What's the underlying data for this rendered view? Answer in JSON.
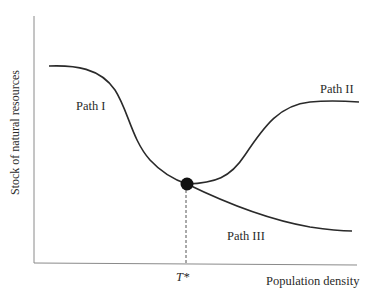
{
  "figure": {
    "y_axis_label": "Stock of natural resources",
    "x_axis_label": "Population density",
    "threshold_label": "T*",
    "paths": [
      {
        "name": "Path I",
        "description": "declining from high stock to threshold point"
      },
      {
        "name": "Path II",
        "description": "recovering upward after threshold"
      },
      {
        "name": "Path III",
        "description": "continuing decline after threshold"
      }
    ]
  },
  "labels": {
    "path1": "Path I",
    "path2": "Path II",
    "path3": "Path III"
  },
  "colors": {
    "curve": "#2a2a2a",
    "axis": "#8a8a8a",
    "dot": "#111111"
  }
}
